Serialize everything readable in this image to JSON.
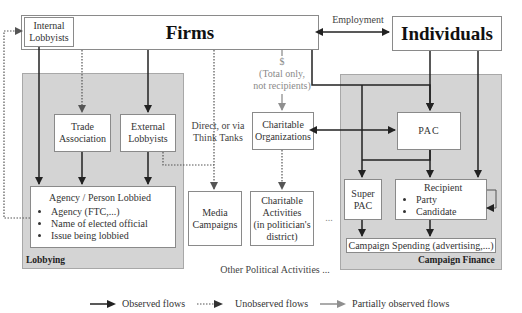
{
  "diagram": {
    "nodes": {
      "firms": "Firms",
      "individuals": "Individuals",
      "internal_lobbyists": [
        "Internal",
        "Lobbyists"
      ],
      "trade_association": [
        "Trade",
        "Association"
      ],
      "external_lobbyists": [
        "External",
        "Lobbyists"
      ],
      "agency_person": {
        "title": "Agency / Person Lobbied",
        "items": [
          "Agency (FTC,...)",
          "Name of elected official",
          "Issue being lobbied"
        ]
      },
      "charitable_organizations": [
        "Charitable",
        "Organizations"
      ],
      "media_campaigns": [
        "Media",
        "Campaigns"
      ],
      "charitable_activities": [
        "Charitable",
        "Activities",
        "(in politician's",
        "district)"
      ],
      "pac": "PAC",
      "super_pac": [
        "Super",
        "PAC"
      ],
      "recipient": {
        "title": "Recipient",
        "items": [
          "Party",
          "Candidate"
        ]
      },
      "campaign_spending": "Campaign Spending (advertising,...)"
    },
    "regions": {
      "lobbying": "Lobbying",
      "campaign_finance": "Campaign Finance"
    },
    "labels": {
      "employment": "Employment",
      "dollar_note": [
        "$",
        "(Total only,",
        "not recipients)"
      ],
      "direct_think_tanks": [
        "Direct, or via",
        "Think Tanks"
      ],
      "ellipsis": "...",
      "other_political": "Other Political Activities ..."
    },
    "legend": [
      {
        "style": "solid",
        "label": "Observed flows"
      },
      {
        "style": "dotted",
        "label": "Unobserved flows"
      },
      {
        "style": "grey",
        "label": "Partially observed flows"
      }
    ],
    "colors": {
      "region_fill": "#d4d4d4",
      "observed": "#222222",
      "partial": "#9a9a9a"
    }
  }
}
